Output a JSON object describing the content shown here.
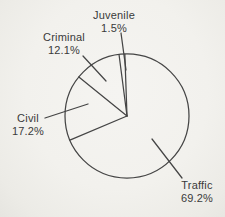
{
  "chart_data": {
    "type": "pie",
    "categories": [
      "Juvenile",
      "Criminal",
      "Civil",
      "Traffic"
    ],
    "values": [
      1.5,
      12.1,
      17.2,
      69.2
    ],
    "pct_labels": [
      "1.5%",
      "12.1%",
      "17.2%",
      "69.2%"
    ],
    "title": "",
    "legend": "none",
    "start_angle_deg": 92,
    "direction": "counterclockwise",
    "slice_fill": "none",
    "label_style": "outside labels with leader lines"
  },
  "colors": {
    "line": "#454545",
    "text": "#3a3a3a",
    "page_bg": "#f2f1ed"
  },
  "layout": {
    "cx": 127,
    "cy": 116,
    "r": 62,
    "stroke_width": 1.25,
    "leaders": [
      [
        121,
        33,
        126,
        70
      ],
      [
        83,
        56,
        106,
        81
      ],
      [
        45,
        118,
        88,
        104
      ],
      [
        152,
        139,
        182,
        178
      ]
    ],
    "label_positions": [
      {
        "x": 114,
        "y": 10
      },
      {
        "x": 64,
        "y": 32
      },
      {
        "x": 28,
        "y": 113
      },
      {
        "x": 197,
        "y": 180
      }
    ]
  }
}
